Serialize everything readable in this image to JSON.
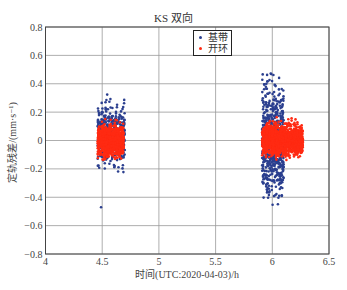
{
  "chart_data": {
    "type": "scatter",
    "title": "KS 双向",
    "xlabel": "时间(UTC:2020-04-03)/h",
    "ylabel": "定轨残差/(mm·s⁻¹)",
    "xlim": [
      4,
      6.5
    ],
    "ylim": [
      -0.8,
      0.8
    ],
    "xticks": [
      "4",
      "4.5",
      "5",
      "5.5",
      "6",
      "6.5"
    ],
    "yticks": [
      "-0.8",
      "-0.6",
      "-0.4",
      "-0.2",
      "0",
      "0.2",
      "0.4",
      "0.6",
      "0.8"
    ],
    "grid": true,
    "legend_position": "upper center",
    "series": [
      {
        "name": "基带",
        "color": "#2b3f8f",
        "clusters": [
          {
            "x_range": [
              4.46,
              4.7
            ],
            "y_range": [
              -0.3,
              0.39
            ],
            "count": 420
          },
          {
            "x_range": [
              5.91,
              6.1
            ],
            "y_range": [
              -0.63,
              0.62
            ],
            "count": 650
          }
        ],
        "outliers": [
          {
            "x": 4.49,
            "y": -0.47
          }
        ]
      },
      {
        "name": "开环",
        "color": "#ff2a12",
        "clusters": [
          {
            "x_range": [
              4.46,
              4.69
            ],
            "y_range": [
              -0.17,
              0.17
            ],
            "count": 900
          },
          {
            "x_range": [
              5.91,
              6.27
            ],
            "y_range": [
              -0.17,
              0.18
            ],
            "count": 1300
          }
        ],
        "outliers": []
      }
    ]
  },
  "legend": {
    "items": [
      {
        "label": "基带",
        "color": "#2b3f8f"
      },
      {
        "label": "开环",
        "color": "#ff2a12"
      }
    ]
  }
}
